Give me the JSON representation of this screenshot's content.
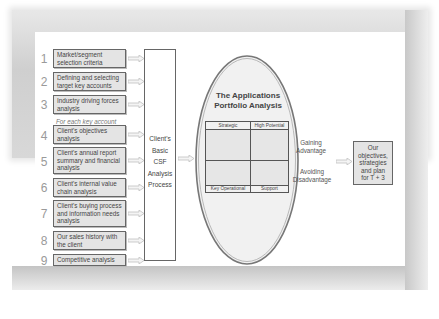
{
  "steps": [
    {
      "number": "1",
      "label": "Market/segment selection criteria"
    },
    {
      "number": "2",
      "label": "Defining and selecting target key accounts"
    },
    {
      "number": "3",
      "label": "Industry driving forces analysis"
    },
    {
      "number": "4",
      "label": "Client's objectives analysis"
    },
    {
      "number": "5",
      "label": "Client's annual report summary and financial analysis"
    },
    {
      "number": "6",
      "label": "Client's internal value chain analysis"
    },
    {
      "number": "7",
      "label": "Client's buying process and information needs analysis"
    },
    {
      "number": "8",
      "label": "Our sales history with the client"
    },
    {
      "number": "9",
      "label": "Competitive analysis"
    }
  ],
  "section_note": "For each key account",
  "csf_process": {
    "lines": [
      "Client's",
      "Basic",
      "CSF",
      "Analysis",
      "Process"
    ]
  },
  "portfolio": {
    "title_line1": "The Applications",
    "title_line2": "Portfolio Analysis",
    "quadrants": {
      "top_left": "Strategic",
      "top_right": "High Potential",
      "bottom_left": "Key Operational",
      "bottom_right": "Support"
    },
    "gaining": [
      "Gaining",
      "Advantage"
    ],
    "avoiding": [
      "Avoiding",
      "Disadvantage"
    ]
  },
  "output": {
    "lines": [
      "Our",
      "objectives,",
      "strategies",
      "and plan",
      "for T + 3"
    ]
  },
  "colors": {
    "box_fill": "#e4e4e4",
    "border": "#666666",
    "arrow": "#c8c8c8",
    "oval_fill": "#f0f0f0"
  }
}
